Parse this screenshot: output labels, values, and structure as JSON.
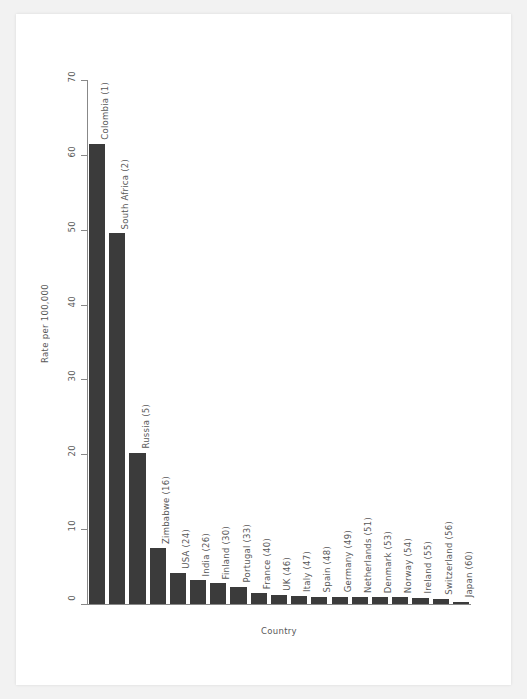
{
  "figure": {
    "background": "#ffffff",
    "page_background": "#f2f2f2",
    "bar_color": "#3b3b3b",
    "axis_color": "#888888",
    "text_color": "#585858"
  },
  "chart_data": {
    "type": "bar",
    "title": "",
    "xlabel": "Country",
    "ylabel": "Rate per 100,000",
    "ylim": [
      0,
      70
    ],
    "yticks": [
      0,
      10,
      20,
      30,
      40,
      50,
      60,
      70
    ],
    "grid": false,
    "legend": null,
    "categories": [
      "Colombia (1)",
      "South Africa (2)",
      "Russia (5)",
      "Zimbabwe (16)",
      "USA (24)",
      "India (26)",
      "Finland (30)",
      "Portugal (33)",
      "France (40)",
      "UK (46)",
      "Italy (47)",
      "Spain (48)",
      "Germany (49)",
      "Netherlands (51)",
      "Denmark (53)",
      "Norway (54)",
      "Ireland (55)",
      "Switzerland (56)",
      "Japan (60)"
    ],
    "values": [
      61.5,
      49.5,
      20.2,
      7.5,
      4.2,
      3.2,
      2.8,
      2.3,
      1.5,
      1.2,
      1.1,
      1.0,
      1.0,
      1.0,
      0.9,
      0.9,
      0.8,
      0.7,
      0.3
    ]
  }
}
